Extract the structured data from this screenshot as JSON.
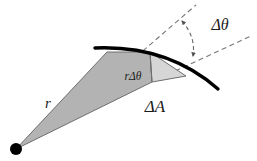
{
  "figure": {
    "type": "geometry-diagram",
    "background_color": "#ffffff",
    "canvas": {
      "width": 257,
      "height": 161
    }
  },
  "labels": {
    "radius": "r",
    "arc_length": "rΔθ",
    "swept_area": "ΔA",
    "angle": "Δθ"
  },
  "label_positions": {
    "radius": {
      "x": 48,
      "y": 108
    },
    "arc_length": {
      "x": 118,
      "y": 80
    },
    "swept_area": {
      "x": 139,
      "y": 112
    },
    "angle": {
      "x": 205,
      "y": 30
    }
  },
  "colors": {
    "stroke": "#000000",
    "curve": "#000000",
    "wedge_dark_fill": "#b3b3b3",
    "wedge_light_fill": "#d6d6d6",
    "wedge_edge": "#6e6e6e",
    "dashed_line": "#777777",
    "vertex_dot": "#000000",
    "text": "#1a1a1a"
  },
  "geometry": {
    "vertex": {
      "x": 16,
      "y": 149,
      "radius": 6
    },
    "wedge_dark_points": "16,149 107,52 150,52 152,82",
    "wedge_light_points": "150,52 186,76 152,82",
    "arc": {
      "start": {
        "x": 95,
        "y": 48
      },
      "control": {
        "x": 168,
        "y": 45
      },
      "end": {
        "x": 218,
        "y": 89
      },
      "stroke_width": 3.4
    },
    "chord_line": {
      "x1": 150,
      "y1": 52,
      "x2": 152,
      "y2": 82
    },
    "dashed_tangent_left": {
      "x1": 130,
      "y1": 62,
      "x2": 196,
      "y2": 5
    },
    "dashed_tangent_right": {
      "x1": 160,
      "y1": 78,
      "x2": 251,
      "y2": 36
    },
    "angle_arc_arrow": {
      "start": {
        "x": 182,
        "y": 21
      },
      "control": {
        "x": 196,
        "y": 37
      },
      "end": {
        "x": 193,
        "y": 56
      }
    }
  },
  "elements": {
    "vertex_dot_name": "origin-vertex-dot",
    "arc_name": "curved-boundary-arc",
    "dark_wedge_name": "swept-area-wedge-dark",
    "light_wedge_name": "swept-area-wedge-light"
  }
}
